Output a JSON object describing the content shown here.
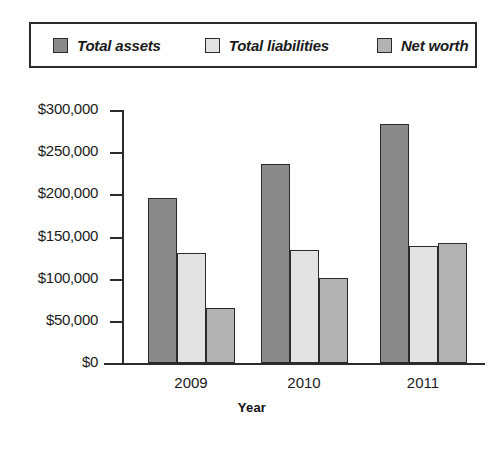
{
  "legend": {
    "items": [
      {
        "label": "Total assets",
        "color": "#8a8a8a"
      },
      {
        "label": "Total liabilities",
        "color": "#e3e3e3"
      },
      {
        "label": "Net worth",
        "color": "#b3b3b3"
      }
    ]
  },
  "axis": {
    "y_ticks": [
      "$300,000",
      "$250,000",
      "$200,000",
      "$150,000",
      "$100,000",
      "$50,000",
      "$0"
    ],
    "x_title": "Year"
  },
  "chart_data": {
    "type": "bar",
    "title": "",
    "subtitle": "",
    "xlabel": "Year",
    "ylabel": "",
    "categories": [
      "2009",
      "2010",
      "2011"
    ],
    "series": [
      {
        "name": "Total assets",
        "color": "#8a8a8a",
        "values": [
          196000,
          236000,
          283000
        ]
      },
      {
        "name": "Total liabilities",
        "color": "#e3e3e3",
        "values": [
          130000,
          134000,
          139000
        ]
      },
      {
        "name": "Net worth",
        "color": "#b3b3b3",
        "values": [
          65000,
          101000,
          142000
        ]
      }
    ],
    "ylim": [
      0,
      300000
    ],
    "ytick_values": [
      0,
      50000,
      100000,
      150000,
      200000,
      250000,
      300000
    ],
    "ytick_labels": [
      "$0",
      "$50,000",
      "$100,000",
      "$150,000",
      "$200,000",
      "$250,000",
      "$300,000"
    ],
    "grid": false,
    "legend_position": "top",
    "value_prefix": "$"
  }
}
